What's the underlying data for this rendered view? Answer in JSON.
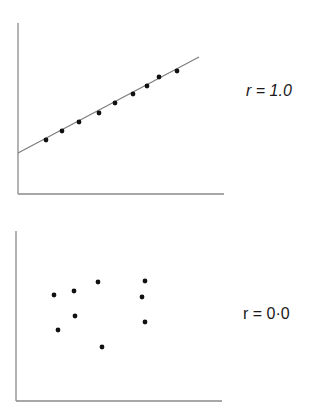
{
  "chart_data": [
    {
      "type": "scatter",
      "title": "",
      "label": "r = 1.0",
      "label_italic": true,
      "xlabel": "",
      "ylabel": "",
      "grid": false,
      "has_fit_line": true,
      "axes_px": {
        "x0": 18,
        "y_top": 23,
        "y_axis_bottom": 194,
        "x_end": 224
      },
      "fit_line_px": {
        "x1": 18,
        "y1": 153,
        "x2": 199,
        "y2": 57
      },
      "points_px": [
        {
          "x": 46,
          "y": 140
        },
        {
          "x": 62,
          "y": 131
        },
        {
          "x": 79,
          "y": 122
        },
        {
          "x": 99,
          "y": 113
        },
        {
          "x": 115,
          "y": 103
        },
        {
          "x": 133,
          "y": 94
        },
        {
          "x": 147,
          "y": 86
        },
        {
          "x": 159,
          "y": 77
        },
        {
          "x": 177,
          "y": 71
        }
      ],
      "x": [
        1,
        2,
        3,
        4,
        5,
        6,
        7,
        8,
        9
      ],
      "y": [
        1,
        2,
        3,
        4,
        5,
        6,
        7,
        8,
        9
      ],
      "correlation": 1.0
    },
    {
      "type": "scatter",
      "title": "",
      "label": "r = 0·0",
      "label_italic": false,
      "xlabel": "",
      "ylabel": "",
      "grid": false,
      "has_fit_line": false,
      "axes_px": {
        "x0": 16,
        "y_top": 231,
        "y_axis_bottom": 401,
        "x_end": 222
      },
      "points_px": [
        {
          "x": 54,
          "y": 295
        },
        {
          "x": 74,
          "y": 291
        },
        {
          "x": 98,
          "y": 282
        },
        {
          "x": 145,
          "y": 281
        },
        {
          "x": 142,
          "y": 297
        },
        {
          "x": 75,
          "y": 316
        },
        {
          "x": 58,
          "y": 330
        },
        {
          "x": 145,
          "y": 322
        },
        {
          "x": 102,
          "y": 347
        }
      ],
      "correlation": 0.0
    }
  ],
  "labels": {
    "top": "r = 1.0",
    "bottom": "r = 0·0"
  },
  "colors": {
    "axis": "#8a8a8a",
    "line": "#7a7a7a",
    "point": "#111111",
    "text": "#1a1a1a"
  }
}
